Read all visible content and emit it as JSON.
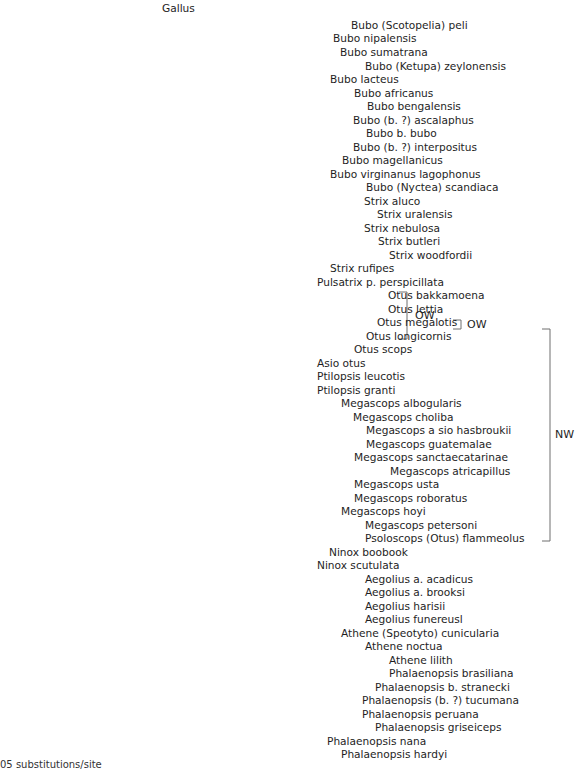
{
  "figure": {
    "type": "phylogenetic-tree",
    "line_color": "#6e6e6e",
    "text_color": "#1e1e1e",
    "scale_caption": "05 substitutions/site"
  },
  "leaves": [
    {
      "name": "Gallus",
      "x": 162,
      "y": 8
    },
    {
      "name": "Bubo (Scotopelia) peli",
      "x": 351,
      "y": 25
    },
    {
      "name": "Bubo nipalensis",
      "x": 333,
      "y": 38
    },
    {
      "name": "Bubo sumatrana",
      "x": 340,
      "y": 52
    },
    {
      "name": "Bubo (Ketupa) zeylonensis",
      "x": 365,
      "y": 66
    },
    {
      "name": "Bubo lacteus",
      "x": 330,
      "y": 79
    },
    {
      "name": "Bubo africanus",
      "x": 354,
      "y": 93
    },
    {
      "name": "Bubo bengalensis",
      "x": 367,
      "y": 106
    },
    {
      "name": "Bubo (b. ?) ascalaphus",
      "x": 353,
      "y": 120
    },
    {
      "name": "Bubo b. bubo",
      "x": 366,
      "y": 133
    },
    {
      "name": "Bubo (b. ?) interpositus",
      "x": 353,
      "y": 147
    },
    {
      "name": "Bubo magellanicus",
      "x": 342,
      "y": 160
    },
    {
      "name": "Bubo virginanus lagophonus",
      "x": 330,
      "y": 174
    },
    {
      "name": "Bubo (Nyctea) scandiaca",
      "x": 366,
      "y": 187
    },
    {
      "name": "Strix aluco",
      "x": 364,
      "y": 201
    },
    {
      "name": "Strix uralensis",
      "x": 377,
      "y": 214
    },
    {
      "name": "Strix nebulosa",
      "x": 364,
      "y": 228
    },
    {
      "name": "Strix butleri",
      "x": 378,
      "y": 241
    },
    {
      "name": "Strix woodfordii",
      "x": 389,
      "y": 255
    },
    {
      "name": "Strix rufipes",
      "x": 330,
      "y": 268
    },
    {
      "name": "Pulsatrix p. perspicillata",
      "x": 317,
      "y": 282
    },
    {
      "name": "Otus bakkamoena",
      "x": 388,
      "y": 295
    },
    {
      "name": "Otus lettia",
      "x": 388,
      "y": 309
    },
    {
      "name": "Otus megalotis",
      "x": 377,
      "y": 322
    },
    {
      "name": "Otus longicornis",
      "x": 366,
      "y": 336
    },
    {
      "name": "Otus scops",
      "x": 354,
      "y": 349
    },
    {
      "name": "Asio otus",
      "x": 317,
      "y": 363
    },
    {
      "name": "Ptilopsis leucotis",
      "x": 317,
      "y": 376
    },
    {
      "name": "Ptilopsis granti",
      "x": 317,
      "y": 390
    },
    {
      "name": "Megascops albogularis",
      "x": 341,
      "y": 403
    },
    {
      "name": "Megascops choliba",
      "x": 353,
      "y": 417
    },
    {
      "name": "Megascops a sio hasbroukii",
      "x": 366,
      "y": 430
    },
    {
      "name": "Megascops guatemalae",
      "x": 366,
      "y": 444
    },
    {
      "name": "Megascops sanctaecatarinae",
      "x": 354,
      "y": 457
    },
    {
      "name": "Megascops atricapillus",
      "x": 390,
      "y": 471
    },
    {
      "name": "Megascops usta",
      "x": 354,
      "y": 484
    },
    {
      "name": "Megascops roboratus",
      "x": 354,
      "y": 498
    },
    {
      "name": "Megascops hoyi",
      "x": 341,
      "y": 511
    },
    {
      "name": "Megascops petersoni",
      "x": 365,
      "y": 525
    },
    {
      "name": "Psoloscops (Otus) flammeolus",
      "x": 365,
      "y": 538
    },
    {
      "name": "Ninox boobook",
      "x": 329,
      "y": 552
    },
    {
      "name": "Ninox scutulata",
      "x": 317,
      "y": 565
    },
    {
      "name": "Aegolius a. acadicus",
      "x": 365,
      "y": 579
    },
    {
      "name": "Aegolius a. brooksi",
      "x": 365,
      "y": 592
    },
    {
      "name": "Aegolius harisii",
      "x": 365,
      "y": 606
    },
    {
      "name": "Aegolius funereusl",
      "x": 365,
      "y": 619
    },
    {
      "name": "Athene (Speotyto) cunicularia",
      "x": 341,
      "y": 633
    },
    {
      "name": "Athene noctua",
      "x": 365,
      "y": 646
    },
    {
      "name": "Athene lilith",
      "x": 389,
      "y": 660
    },
    {
      "name": "Phalaenopsis brasiliana",
      "x": 389,
      "y": 673
    },
    {
      "name": "Phalaenopsis b. stranecki",
      "x": 375,
      "y": 687
    },
    {
      "name": "Phalaenopsis (b. ?) tucumana",
      "x": 362,
      "y": 700
    },
    {
      "name": "Phalaenopsis peruana",
      "x": 362,
      "y": 714
    },
    {
      "name": "Phalaenopsis griseiceps",
      "x": 375,
      "y": 727
    },
    {
      "name": "Phalaenopsis nana",
      "x": 327,
      "y": 741
    },
    {
      "name": "Phalaenopsis hardyi",
      "x": 341,
      "y": 754
    }
  ],
  "brackets": [
    {
      "label": "OW",
      "x": 407,
      "y1": 292,
      "y2": 339,
      "label_x": 415
    },
    {
      "label": "OW",
      "x": 461,
      "y1": 320,
      "y2": 329,
      "label_x": 467
    },
    {
      "label": "NW",
      "x": 550,
      "y1": 329,
      "y2": 541,
      "label_x": 555
    }
  ]
}
